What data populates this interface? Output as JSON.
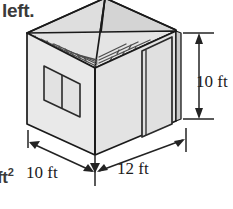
{
  "figure": {
    "title_fragment_top": "left.",
    "title_fragment_bottom": "ft",
    "title_fragment_bottom_sup": "2",
    "dimensions": {
      "height_label": "10 ft",
      "depth_label": "10 ft",
      "width_label": "12 ft"
    },
    "units": "ft",
    "values": {
      "height": 10,
      "depth": 10,
      "width": 12
    },
    "features": {
      "window_label": "window",
      "door_label": "door",
      "roof_label": "shingled hip roof"
    },
    "colors": {
      "outline": "#1a1a1a",
      "wall_front_left": "#e6e6e6",
      "wall_front_right": "#dcdcdc",
      "roof_light": "#e2e2e2",
      "roof_shade": "#cfcfcf",
      "shingle_line": "#4a4a4a",
      "dimension_line": "#2b2b2b",
      "background": "#ffffff"
    }
  }
}
